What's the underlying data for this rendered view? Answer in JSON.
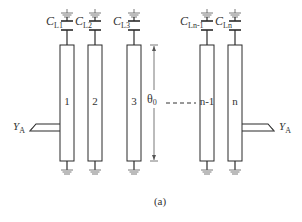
{
  "figure": {
    "caption": "(a)",
    "dimension_label": "θ",
    "dimension_sub": "0",
    "feed_label_main": "Y",
    "feed_label_sub": "A"
  },
  "columns": [
    {
      "id": "1",
      "label": "1",
      "cap_main": "C",
      "cap_sub": "L1",
      "x": 60
    },
    {
      "id": "2",
      "label": "2",
      "cap_main": "C",
      "cap_sub": "L2",
      "x": 88
    },
    {
      "id": "3",
      "label": "3",
      "cap_main": "C",
      "cap_sub": "L3",
      "x": 127
    },
    {
      "id": "n-1",
      "label": "n-1",
      "cap_main": "C",
      "cap_sub": "Ln-1",
      "x": 200
    },
    {
      "id": "n",
      "label": "n",
      "cap_main": "C",
      "cap_sub": "Ln",
      "x": 228
    }
  ],
  "colors": {
    "stroke": "#2a2a2a",
    "ground": "#555555",
    "background": "#ffffff"
  }
}
